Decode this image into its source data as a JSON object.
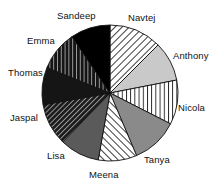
{
  "chart_data": {
    "type": "pie",
    "title": "",
    "subtitle": "",
    "xlabel": "",
    "ylabel": "",
    "legend_position": "none",
    "grid": false,
    "labels_on_chart": true,
    "categories": [
      "Navtej",
      "Anthony",
      "Nicola",
      "Tanya",
      "Meena",
      "Lisa",
      "Jaspal",
      "Thomas",
      "Emma",
      "Sandeep"
    ],
    "values": [
      12.5,
      9.5,
      10.5,
      11.0,
      9.0,
      9.5,
      10.0,
      9.0,
      9.5,
      9.5
    ],
    "units": "percent",
    "slices": [
      {
        "label": "Navtej",
        "value": 12.5,
        "start_angle_deg": 0,
        "end_angle_deg": 45,
        "fill": "#ffffff",
        "pattern": "diagonal-hatch-backslash",
        "pattern_color": "#1a1a1a",
        "label_x": 128,
        "label_y": 13
      },
      {
        "label": "Anthony",
        "value": 9.5,
        "start_angle_deg": 45,
        "end_angle_deg": 79,
        "fill": "#c9c9c9",
        "pattern": "solid",
        "pattern_color": "#c9c9c9",
        "label_x": 173,
        "label_y": 51
      },
      {
        "label": "Nicola",
        "value": 10.5,
        "start_angle_deg": 79,
        "end_angle_deg": 117,
        "fill": "#ffffff",
        "pattern": "vertical-stripes",
        "pattern_color": "#1a1a1a",
        "label_x": 178,
        "label_y": 103
      },
      {
        "label": "Tanya",
        "value": 11.0,
        "start_angle_deg": 117,
        "end_angle_deg": 157,
        "fill": "#8a8a8a",
        "pattern": "solid",
        "pattern_color": "#8a8a8a",
        "label_x": 144,
        "label_y": 155
      },
      {
        "label": "Meena",
        "value": 9.0,
        "start_angle_deg": 157,
        "end_angle_deg": 190,
        "fill": "#ffffff",
        "pattern": "diagonal-hatch-slash",
        "pattern_color": "#1a1a1a",
        "label_x": 89,
        "label_y": 170
      },
      {
        "label": "Lisa",
        "value": 9.5,
        "start_angle_deg": 190,
        "end_angle_deg": 224,
        "fill": "#5a5a5a",
        "pattern": "solid",
        "pattern_color": "#5a5a5a",
        "label_x": 47,
        "label_y": 151
      },
      {
        "label": "Jaspal",
        "value": 10.0,
        "start_angle_deg": 224,
        "end_angle_deg": 260,
        "fill": "#222222",
        "pattern": "dark-diagonal-hatch",
        "pattern_color": "#ffffff",
        "label_x": 10,
        "label_y": 113
      },
      {
        "label": "Thomas",
        "value": 9.0,
        "start_angle_deg": 260,
        "end_angle_deg": 292,
        "fill": "#151515",
        "pattern": "solid",
        "pattern_color": "#151515",
        "label_x": 8,
        "label_y": 68
      },
      {
        "label": "Emma",
        "value": 9.5,
        "start_angle_deg": 292,
        "end_angle_deg": 326,
        "fill": "#1a1a1a",
        "pattern": "dark-vertical-stripes",
        "pattern_color": "#ffffff",
        "label_x": 27,
        "label_y": 36
      },
      {
        "label": "Sandeep",
        "value": 9.5,
        "start_angle_deg": 326,
        "end_angle_deg": 360,
        "fill": "#000000",
        "pattern": "solid",
        "pattern_color": "#000000",
        "label_x": 57,
        "label_y": 11
      }
    ],
    "geometry": {
      "center_x": 110,
      "center_y": 93,
      "radius": 68
    },
    "colors": {
      "outline": "#111111",
      "background": "#ffffff",
      "text": "#111111"
    }
  }
}
